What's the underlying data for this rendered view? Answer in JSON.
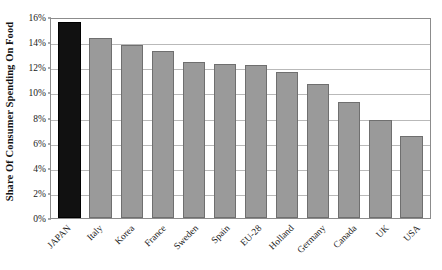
{
  "chart_data": {
    "type": "bar",
    "title": "",
    "xlabel": "",
    "ylabel": "Share Of Consumer Spending On Food",
    "categories": [
      "JAPAN",
      "Italy",
      "Korea",
      "France",
      "Sweden",
      "Spain",
      "EU-28",
      "Holland",
      "Germany",
      "Canada",
      "UK",
      "USA"
    ],
    "values": [
      15.6,
      14.3,
      13.8,
      13.3,
      12.4,
      12.25,
      12.2,
      11.6,
      10.7,
      9.2,
      7.8,
      6.5
    ],
    "value_labels": [
      "15.6%",
      "14.3%",
      "13.8%",
      "13.3%",
      "12.4%",
      "12.3%",
      "12.2%",
      "11.6%",
      "10.7%",
      "9.2%",
      "7.8%",
      "6.5%"
    ],
    "ylim": [
      0,
      16
    ],
    "ytick_values": [
      0,
      2,
      4,
      6,
      8,
      10,
      12,
      14,
      16
    ],
    "ytick_labels": [
      "0%",
      "2%",
      "4%",
      "6%",
      "8%",
      "10%",
      "12%",
      "14%",
      "16%"
    ],
    "grid": true,
    "grid_axis": "y",
    "legend": "none",
    "highlight_category": "JAPAN",
    "colors": {
      "bar": "#9a9a9a",
      "bar_border": "#6f6f6f",
      "highlight_bar": "#111111",
      "gridline": "#b9b9b9",
      "plot_border": "#8c8c8c",
      "text": "#1a1a1a",
      "background": "#ffffff"
    }
  }
}
